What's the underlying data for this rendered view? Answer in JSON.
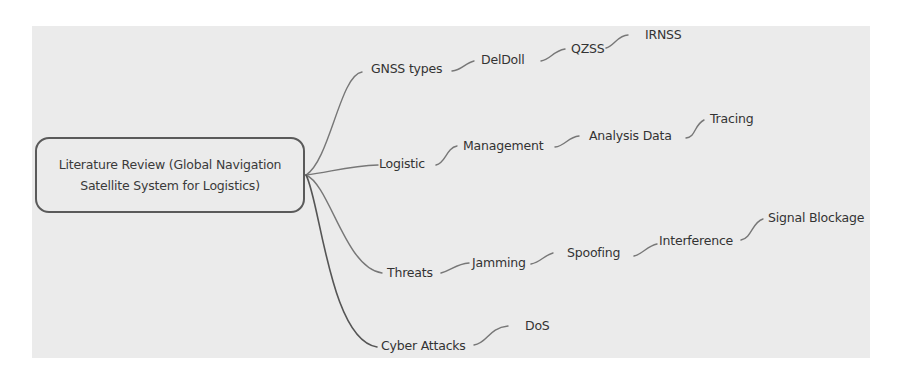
{
  "root": {
    "line1": "Literature Review (Global Navigation",
    "line2": "Satellite System for Logistics)"
  },
  "branches": [
    {
      "label": "GNSS types",
      "children": [
        "DelDoll",
        "QZSS",
        "IRNSS"
      ]
    },
    {
      "label": "Logistic",
      "children": [
        "Management",
        "Analysis Data",
        "Tracing"
      ]
    },
    {
      "label": "Threats",
      "children": [
        "Jamming",
        "Spoofing",
        "Interference",
        "Signal Blockage"
      ]
    },
    {
      "label": "Cyber Attacks",
      "children": [
        "DoS"
      ]
    }
  ],
  "colors": {
    "canvas": "#ebebeb",
    "line": "#6e6e6e",
    "text": "#333333"
  }
}
